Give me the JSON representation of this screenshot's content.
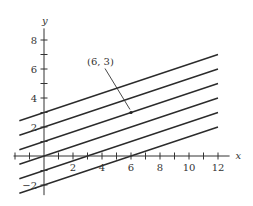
{
  "chart_data": {
    "type": "line",
    "title": "",
    "xlabel": "x",
    "ylabel": "y",
    "xlim": [
      -3,
      13
    ],
    "ylim": [
      -3,
      9
    ],
    "x_ticks": [
      -2,
      -1,
      0,
      1,
      2,
      3,
      4,
      5,
      6,
      7,
      8,
      9,
      10,
      11,
      12
    ],
    "x_tick_labels": [
      {
        "value": 2,
        "label": "2"
      },
      {
        "value": 4,
        "label": "4"
      },
      {
        "value": 6,
        "label": "6"
      },
      {
        "value": 8,
        "label": "8"
      },
      {
        "value": 10,
        "label": "10"
      },
      {
        "value": 12,
        "label": "12"
      }
    ],
    "y_ticks": [
      -2,
      -1,
      1,
      2,
      3,
      4,
      5,
      6,
      7,
      8
    ],
    "y_tick_labels": [
      {
        "value": 8,
        "label": "8"
      },
      {
        "value": 6,
        "label": "6"
      },
      {
        "value": 4,
        "label": "4"
      },
      {
        "value": 2,
        "label": "2"
      },
      {
        "value": -2,
        "label": "−2"
      }
    ],
    "grid": false,
    "series": [
      {
        "name": "y = x/3 + 3",
        "slope": 0.3333,
        "intercept": 3,
        "x": [
          -2,
          12
        ]
      },
      {
        "name": "y = x/3 + 2",
        "slope": 0.3333,
        "intercept": 2,
        "x": [
          -2,
          12
        ]
      },
      {
        "name": "y = x/3 + 1",
        "slope": 0.3333,
        "intercept": 1,
        "x": [
          -2,
          12
        ]
      },
      {
        "name": "y = x/3",
        "slope": 0.3333,
        "intercept": 0,
        "x": [
          -2,
          12
        ]
      },
      {
        "name": "y = x/3 - 1",
        "slope": 0.3333,
        "intercept": -1,
        "x": [
          -2,
          12
        ]
      },
      {
        "name": "y = x/3 - 2",
        "slope": 0.3333,
        "intercept": -2,
        "x": [
          -2,
          12
        ]
      }
    ],
    "annotations": [
      {
        "text": "(6, 3)",
        "point": [
          6,
          3
        ]
      }
    ]
  }
}
